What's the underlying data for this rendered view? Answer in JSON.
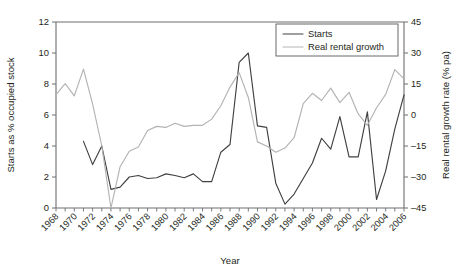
{
  "chart_data": {
    "type": "line",
    "title": "",
    "xlabel": "Year",
    "ylabel": "Starts as % occupied stock",
    "ylabel_right": "Real rental growth rate (% pa)",
    "grid": false,
    "legend_position": "top-right",
    "xlim": [
      1968,
      2006
    ],
    "ylim": [
      0,
      12
    ],
    "ylim_right": [
      -45,
      45
    ],
    "xticks": [
      1968,
      1970,
      1972,
      1974,
      1976,
      1978,
      1980,
      1982,
      1984,
      1986,
      1988,
      1990,
      1992,
      1994,
      1996,
      1998,
      2000,
      2002,
      2004,
      2006
    ],
    "xticks_minor_step": 1,
    "yticks_left": [
      0,
      2,
      4,
      6,
      8,
      10,
      12
    ],
    "yticks_right": [
      -45,
      -30,
      -15,
      0,
      15,
      30,
      45
    ],
    "x": [
      1968,
      1969,
      1970,
      1971,
      1972,
      1973,
      1974,
      1975,
      1976,
      1977,
      1978,
      1979,
      1980,
      1981,
      1982,
      1983,
      1984,
      1985,
      1986,
      1987,
      1988,
      1989,
      1990,
      1991,
      1992,
      1993,
      1994,
      1995,
      1996,
      1997,
      1998,
      1999,
      2000,
      2001,
      2002,
      2003,
      2004,
      2005,
      2006
    ],
    "series": [
      {
        "name": "Starts",
        "axis": "left",
        "color": "#414042",
        "units": "% of occupied stock",
        "values": [
          null,
          null,
          null,
          4.3,
          2.8,
          4.0,
          1.2,
          1.35,
          2.0,
          2.1,
          1.9,
          1.95,
          2.2,
          2.1,
          1.95,
          2.2,
          1.7,
          1.7,
          3.6,
          4.1,
          9.4,
          10.0,
          5.3,
          5.2,
          1.6,
          0.25,
          0.9,
          1.9,
          2.9,
          4.5,
          3.8,
          5.9,
          3.3,
          3.3,
          6.2,
          0.55,
          2.4,
          5.1,
          7.3
        ]
      },
      {
        "name": "Real rental growth",
        "axis": "right",
        "color": "#b3b3b3",
        "units": "% pa",
        "values": [
          9.9,
          15.2,
          9.3,
          22.2,
          5.3,
          -15.0,
          -45.0,
          -25.0,
          -17.5,
          -15.5,
          -7.5,
          -5.5,
          -6.0,
          -4.0,
          -5.5,
          -5.0,
          -5.0,
          -2.0,
          4.5,
          13.5,
          20.5,
          8.5,
          -13.0,
          -15.0,
          -18.0,
          -16.0,
          -11.0,
          5.5,
          10.5,
          7.0,
          13.0,
          6.0,
          11.0,
          0.5,
          -5.0,
          3.5,
          10.0,
          22.0,
          17.5
        ]
      }
    ]
  },
  "legend": {
    "entries": [
      {
        "label": "Starts"
      },
      {
        "label": "Real rental growth"
      }
    ]
  },
  "axes": {
    "x_title": "Year",
    "y_left_title": "Starts as % occupied stock",
    "y_right_title": "Real rental growth rate (% pa)"
  }
}
